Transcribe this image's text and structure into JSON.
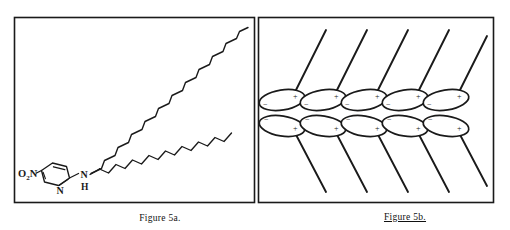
{
  "figure": {
    "background_color": "#ffffff",
    "ink_color": "#1a1a1a",
    "panels": [
      {
        "id": "panel-a",
        "caption": "Figure 5a.",
        "caption_underlined": false,
        "frame": {
          "x": 14,
          "y": 17,
          "width": 241,
          "height": 186
        },
        "content_type": "chemical-structure",
        "description": "nitropyridyl-amino long-chain amphiphile"
      },
      {
        "id": "panel-b",
        "caption": "Figure 5b.",
        "caption_underlined": true,
        "frame": {
          "x": 258,
          "y": 17,
          "width": 236,
          "height": 186
        },
        "content_type": "molecular-packing-diagram",
        "description": "head-to-head bilayer packing of dipolar head groups with tilted alkyl tails"
      }
    ]
  },
  "molecule": {
    "labels": {
      "nitro": "O₂N",
      "ring_nitrogen": "N",
      "amine_nitrogen": "N",
      "amine_hydrogen": "H"
    },
    "ring": {
      "type": "pyridine",
      "vertices": 6,
      "double_bonds": 3
    },
    "chain": {
      "type": "alkyl-zigzag",
      "segments": 30,
      "direction": "up-right"
    }
  },
  "packing": {
    "rows": [
      {
        "id": "upper-row",
        "count": 5,
        "tail_direction": "up-right",
        "heads": [
          {
            "left_charge": "−",
            "right_charge": "+"
          },
          {
            "left_charge": "−",
            "right_charge": "+"
          },
          {
            "left_charge": "−",
            "right_charge": "+"
          },
          {
            "left_charge": "−",
            "right_charge": "+"
          },
          {
            "left_charge": "−",
            "right_charge": "+"
          }
        ]
      },
      {
        "id": "lower-row",
        "count": 5,
        "tail_direction": "down-right",
        "heads": [
          {
            "left_charge": "−",
            "right_charge": "+"
          },
          {
            "left_charge": "−",
            "right_charge": "+"
          },
          {
            "left_charge": "−",
            "right_charge": "+"
          },
          {
            "left_charge": "−",
            "right_charge": "+"
          },
          {
            "left_charge": "−",
            "right_charge": "+"
          }
        ]
      }
    ]
  }
}
